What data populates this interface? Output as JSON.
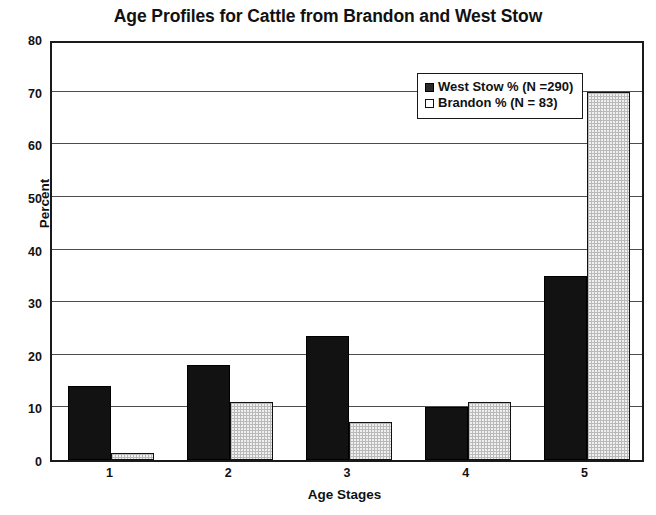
{
  "chart_data": {
    "type": "bar",
    "title": "Age Profiles for Cattle from Brandon and West Stow",
    "xlabel": "Age Stages",
    "ylabel": "Percent",
    "categories": [
      "1",
      "2",
      "3",
      "4",
      "5"
    ],
    "series": [
      {
        "name": "West Stow % (N =290)",
        "color": "#121212",
        "values": [
          14,
          18,
          23.5,
          10,
          35
        ]
      },
      {
        "name": "Brandon % (N = 83)",
        "color": "#f0f0f0",
        "values": [
          1.3,
          11,
          7.2,
          11,
          70
        ]
      }
    ],
    "ylim": [
      0,
      80
    ],
    "yticks": [
      0,
      10,
      20,
      30,
      40,
      50,
      60,
      70,
      80
    ],
    "ytick_labels": [
      "0",
      "10",
      "20",
      "30",
      "40",
      "50",
      "60",
      "70",
      "80"
    ],
    "grid": true,
    "legend_position": "top-right"
  }
}
